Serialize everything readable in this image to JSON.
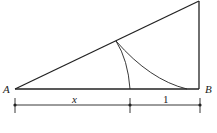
{
  "diagram": {
    "labels": {
      "point_a": "A",
      "point_b": "B",
      "segment_x": "x",
      "segment_one": "1"
    },
    "colors": {
      "stroke": "#222222",
      "background": "#ffffff"
    }
  }
}
